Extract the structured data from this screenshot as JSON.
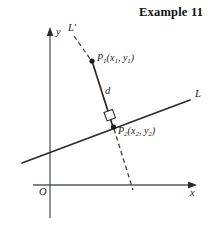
{
  "figure": {
    "title": "Example 11",
    "background_color": "#ffffff",
    "ink_color": "#1a1a1a",
    "width": 215,
    "height": 227,
    "axes": {
      "x_axis_label": "x",
      "y_axis_label": "y",
      "origin_label": "O",
      "x_axis": {
        "x1": 33,
        "y1": 185,
        "x2": 197,
        "y2": 185,
        "arrow": "right"
      },
      "y_axis": {
        "x1": 50,
        "y1": 218,
        "x2": 50,
        "y2": 28,
        "arrow": "up"
      }
    },
    "lines": [
      {
        "name": "line-L",
        "label": "L",
        "style": "solid",
        "x1": 22,
        "y1": 163,
        "x2": 190,
        "y2": 100
      },
      {
        "name": "line-L-prime-upper",
        "label": "L'",
        "style": "dashed",
        "x1": 74,
        "y1": 36,
        "x2": 92,
        "y2": 61
      },
      {
        "name": "line-L-prime-lower",
        "label": "",
        "style": "dashed",
        "x1": 113,
        "y1": 127,
        "x2": 133,
        "y2": 190
      },
      {
        "name": "segment-d",
        "label": "d",
        "style": "solid",
        "x1": 92,
        "y1": 61,
        "x2": 113,
        "y2": 127
      }
    ],
    "points": [
      {
        "name": "point-P1",
        "label": "P",
        "subscript": "1",
        "coords": "(x",
        "sub1": "1",
        "mid": ", y",
        "sub2": "1",
        "close": ")",
        "full_label": "P₁(x₁, y₁)",
        "x": 92,
        "y": 61
      },
      {
        "name": "point-P2",
        "label": "P",
        "subscript": "2",
        "full_label": "P₂(x₂, y₂)",
        "x": 113,
        "y": 127
      }
    ],
    "markers": {
      "right_angle": {
        "name": "right-angle-marker",
        "x": 105,
        "y": 117,
        "size": 9
      }
    },
    "distance_label": "d",
    "point1_text": {
      "base": "P",
      "sub": "1",
      "open": "(x",
      "sub_a": "1",
      "comma": ", y",
      "sub_b": "1",
      "close": ")"
    },
    "point2_text": {
      "base": "P",
      "sub": "2",
      "open": "(x",
      "sub_a": "2",
      "comma": ", y",
      "sub_b": "2",
      "close": ")"
    }
  }
}
